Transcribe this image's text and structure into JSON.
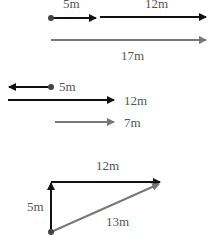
{
  "colors": {
    "black_vector": "#111111",
    "gray_vector": "#777777",
    "point": "#444444",
    "label": "#555555"
  },
  "diagram_1": {
    "title": "Collinear vectors, same direction",
    "vector_a": {
      "label": "5m",
      "direction": "right"
    },
    "vector_b": {
      "label": "12m",
      "direction": "right"
    },
    "resultant": {
      "label": "17m",
      "direction": "right"
    }
  },
  "diagram_2": {
    "title": "Collinear vectors, opposite direction",
    "vector_a": {
      "label": "5m",
      "direction": "left"
    },
    "vector_b": {
      "label": "12m",
      "direction": "right"
    },
    "resultant": {
      "label": "7m",
      "direction": "right"
    }
  },
  "diagram_3": {
    "title": "Perpendicular vectors",
    "vector_a": {
      "label": "5m",
      "direction": "up"
    },
    "vector_b": {
      "label": "12m",
      "direction": "right"
    },
    "resultant": {
      "label": "13m",
      "direction": "diagonal"
    }
  }
}
